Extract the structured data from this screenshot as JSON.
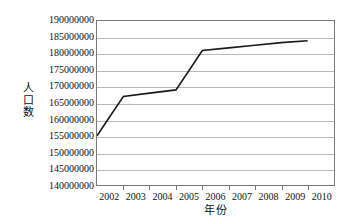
{
  "chart_data": {
    "type": "line",
    "title": "",
    "xlabel": "年份",
    "ylabel": "人口数",
    "x": [
      2002,
      2003,
      2004,
      2005,
      2006,
      2007,
      2008,
      2009,
      2010
    ],
    "categories": [
      "2002",
      "2003",
      "2004",
      "2005",
      "2006",
      "2007",
      "2008",
      "2009",
      "2010"
    ],
    "series": [
      {
        "name": "人口数",
        "values": [
          155000000,
          167000000,
          168000000,
          169000000,
          181000000,
          181800000,
          182600000,
          183400000,
          184000000
        ],
        "color": "#1a1a1a"
      }
    ],
    "ylim": [
      140000000,
      190000000
    ],
    "ytick_labels": [
      "190000000",
      "185000000",
      "180000000",
      "175000000",
      "170000000",
      "165000000",
      "160000000",
      "155000000",
      "150000000",
      "145000000",
      "140000000"
    ],
    "ytick_values": [
      190000000,
      185000000,
      180000000,
      175000000,
      170000000,
      165000000,
      160000000,
      155000000,
      150000000,
      145000000,
      140000000
    ],
    "grid": true,
    "grid_color": "#b8b8b8",
    "legend": false,
    "legend_position": "none",
    "axis_color": "#7a7a7a",
    "background_color": "#ffffff"
  }
}
